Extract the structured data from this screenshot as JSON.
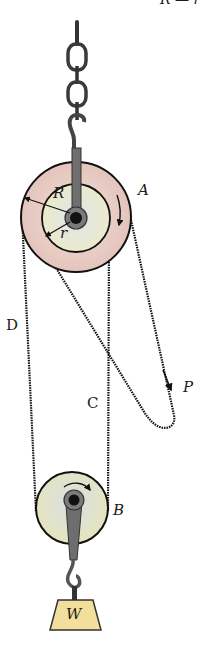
{
  "diagram": {
    "top_caption_fragment": "R — r",
    "labels": {
      "pulley_a": "A",
      "pulley_b": "B",
      "outer_radius": "R",
      "inner_radius": "r",
      "chain_c": "C",
      "chain_d": "D",
      "force": "P",
      "weight": "W"
    },
    "colors": {
      "outer_wheel": "#e8cfc8",
      "inner_wheel": "#e6ebc8",
      "lower_wheel": "#e3e6c2",
      "weight": "#f3df9c",
      "hook_metal": "#6e6e6e",
      "line": "#111111"
    }
  }
}
